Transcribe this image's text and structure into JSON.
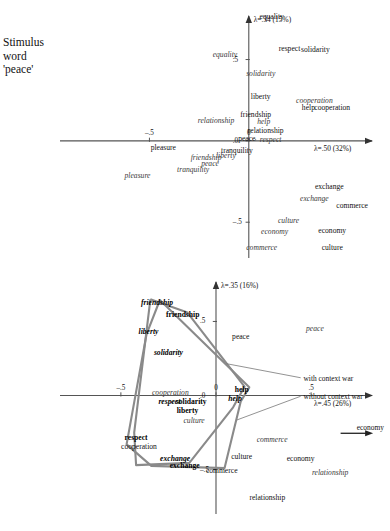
{
  "figure": {
    "stimulus_label": "Stimulus\nword\n'peace'",
    "stimulus_lines": [
      "Stimulus",
      "word",
      "'peace'"
    ]
  },
  "chart_data": [
    {
      "id": "top",
      "type": "scatter",
      "title": "",
      "xlabel": "λ=.50 (32%)",
      "ylabel": "λ=.34 (15%)",
      "xlim": [
        -0.95,
        0.62
      ],
      "ylim": [
        -0.72,
        0.78
      ],
      "xticks": [
        -0.5,
        0
      ],
      "xticklabels": [
        "–.5",
        "0"
      ],
      "yticks": [
        -0.5,
        0,
        0.5
      ],
      "yticklabels": [
        "–.5",
        ".0",
        ".5"
      ],
      "grid": false,
      "legend": "none",
      "points": [
        {
          "label": "equality",
          "style": "roman",
          "x": 0.115,
          "y": 0.76,
          "marker": false
        },
        {
          "label": "respect",
          "style": "roman",
          "x": 0.205,
          "y": 0.565,
          "marker": false
        },
        {
          "label": "solidarity",
          "style": "roman",
          "x": 0.335,
          "y": 0.56,
          "marker": false
        },
        {
          "label": "equality",
          "style": "italic",
          "x": -0.12,
          "y": 0.53,
          "marker": false
        },
        {
          "label": "solidarity",
          "style": "italic",
          "x": 0.06,
          "y": 0.41,
          "marker": false
        },
        {
          "label": "liberty",
          "style": "roman",
          "x": 0.06,
          "y": 0.27,
          "marker": false
        },
        {
          "label": "cooperation",
          "style": "italic",
          "x": 0.33,
          "y": 0.245,
          "marker": false
        },
        {
          "label": "help",
          "style": "roman",
          "x": 0.3,
          "y": 0.205,
          "marker": false
        },
        {
          "label": "cooperation",
          "style": "roman",
          "x": 0.42,
          "y": 0.205,
          "marker": false
        },
        {
          "label": "friendship",
          "style": "roman",
          "x": 0.035,
          "y": 0.16,
          "marker": false
        },
        {
          "label": "relationship",
          "style": "italic",
          "x": -0.165,
          "y": 0.125,
          "marker": false
        },
        {
          "label": "help",
          "style": "italic",
          "x": 0.075,
          "y": 0.118,
          "marker": false
        },
        {
          "label": "relationship",
          "style": "roman",
          "x": 0.085,
          "y": 0.06,
          "marker": false
        },
        {
          "label": "peace",
          "style": "roman",
          "x": -0.01,
          "y": 0.01,
          "marker": false
        },
        {
          "label": "respect",
          "style": "italic",
          "x": 0.11,
          "y": 0.008,
          "marker": true
        },
        {
          "label": "pleasure",
          "style": "roman",
          "x": -0.43,
          "y": -0.045,
          "marker": false
        },
        {
          "label": "tranquility",
          "style": "roman",
          "x": -0.06,
          "y": -0.065,
          "marker": false
        },
        {
          "label": "liberty",
          "style": "italic",
          "x": -0.115,
          "y": -0.095,
          "marker": false
        },
        {
          "label": "friendship",
          "style": "italic",
          "x": -0.215,
          "y": -0.105,
          "marker": false
        },
        {
          "label": "peace",
          "style": "italic",
          "x": -0.195,
          "y": -0.14,
          "marker": false
        },
        {
          "label": "tranquility",
          "style": "italic",
          "x": -0.28,
          "y": -0.18,
          "marker": false
        },
        {
          "label": "pleasure",
          "style": "italic",
          "x": -0.56,
          "y": -0.215,
          "marker": false
        },
        {
          "label": "exchange",
          "style": "roman",
          "x": 0.405,
          "y": -0.285,
          "marker": false
        },
        {
          "label": "exchange",
          "style": "italic",
          "x": 0.33,
          "y": -0.36,
          "marker": false
        },
        {
          "label": "commerce",
          "style": "roman",
          "x": 0.52,
          "y": -0.4,
          "marker": false
        },
        {
          "label": "culture",
          "style": "italic",
          "x": 0.2,
          "y": -0.495,
          "marker": false
        },
        {
          "label": "economy",
          "style": "italic",
          "x": 0.13,
          "y": -0.56,
          "marker": false
        },
        {
          "label": "economy",
          "style": "roman",
          "x": 0.42,
          "y": -0.555,
          "marker": false
        },
        {
          "label": "commerce",
          "style": "italic",
          "x": 0.065,
          "y": -0.66,
          "marker": false
        },
        {
          "label": "culture",
          "style": "roman",
          "x": 0.42,
          "y": -0.66,
          "marker": false
        }
      ]
    },
    {
      "id": "bottom",
      "type": "scatter",
      "title": "",
      "xlabel": "λ=.45 (26%)",
      "ylabel": "λ=.35 (16%)",
      "xlim": [
        -0.82,
        0.82
      ],
      "ylim": [
        -0.8,
        0.78
      ],
      "xticks": [
        -0.5,
        0,
        0.5
      ],
      "xticklabels": [
        "–.5",
        "0",
        ".5"
      ],
      "yticks": [
        -0.5,
        0,
        0.5
      ],
      "yticklabels": [
        "–.5",
        ".0",
        ".5"
      ],
      "grid": false,
      "legend": "none",
      "annotations": [
        {
          "text": "with context war",
          "x": 0.46,
          "y": 0.12
        },
        {
          "text": "without context war",
          "x": 0.46,
          "y": -0.005
        },
        {
          "text": "economy",
          "x": 0.74,
          "y": -0.215
        }
      ],
      "points": [
        {
          "label": "friendship",
          "style": "bolditalic",
          "x": -0.31,
          "y": 0.625,
          "marker": false
        },
        {
          "label": "friendship",
          "style": "bold",
          "x": -0.175,
          "y": 0.545,
          "marker": false
        },
        {
          "label": "peace",
          "style": "italic",
          "x": 0.52,
          "y": 0.45,
          "marker": false
        },
        {
          "label": "liberty",
          "style": "bolditalic",
          "x": -0.355,
          "y": 0.43,
          "marker": false
        },
        {
          "label": "peace",
          "style": "roman",
          "x": 0.13,
          "y": 0.395,
          "marker": false
        },
        {
          "label": "solidarity",
          "style": "bolditalic",
          "x": -0.25,
          "y": 0.285,
          "marker": false
        },
        {
          "label": "cooperation",
          "style": "italic",
          "x": -0.24,
          "y": 0.015,
          "marker": false
        },
        {
          "label": "help",
          "style": "bold",
          "x": 0.135,
          "y": 0.04,
          "marker": false
        },
        {
          "label": "help",
          "style": "bolditalic",
          "x": 0.1,
          "y": -0.025,
          "marker": false
        },
        {
          "label": "respect",
          "style": "bolditalic",
          "x": -0.245,
          "y": -0.045,
          "marker": false
        },
        {
          "label": "solidarity",
          "style": "bold",
          "x": -0.13,
          "y": -0.045,
          "marker": true
        },
        {
          "label": "liberty",
          "style": "bold",
          "x": -0.15,
          "y": -0.105,
          "marker": false
        },
        {
          "label": "culture",
          "style": "italic",
          "x": -0.115,
          "y": -0.17,
          "marker": false
        },
        {
          "label": "respect",
          "style": "bold",
          "x": -0.42,
          "y": -0.285,
          "marker": false
        },
        {
          "label": "cooperation",
          "style": "roman",
          "x": -0.405,
          "y": -0.345,
          "marker": false
        },
        {
          "label": "commerce",
          "style": "italic",
          "x": 0.295,
          "y": -0.3,
          "marker": false
        },
        {
          "label": "exchange",
          "style": "bolditalic",
          "x": -0.215,
          "y": -0.43,
          "marker": false
        },
        {
          "label": "culture",
          "style": "roman",
          "x": 0.135,
          "y": -0.415,
          "marker": false
        },
        {
          "label": "exchange",
          "style": "bold",
          "x": -0.165,
          "y": -0.475,
          "marker": false
        },
        {
          "label": "commerce",
          "style": "roman",
          "x": 0.03,
          "y": -0.51,
          "marker": false
        },
        {
          "label": "economy",
          "style": "roman",
          "x": 0.445,
          "y": -0.43,
          "marker": false
        },
        {
          "label": "relationship",
          "style": "italic",
          "x": 0.6,
          "y": -0.52,
          "marker": false
        },
        {
          "label": "relationship",
          "style": "roman",
          "x": 0.27,
          "y": -0.69,
          "marker": false
        }
      ],
      "polygons": [
        {
          "name": "with-context-war",
          "color": "#8a8a8a",
          "vertices": [
            [
              -0.345,
              0.65
            ],
            [
              -0.15,
              0.56
            ],
            [
              0.15,
              0.06
            ],
            [
              0.09,
              -0.08
            ],
            [
              -0.14,
              -0.455
            ],
            [
              -0.42,
              -0.47
            ],
            [
              -0.43,
              -0.25
            ],
            [
              -0.345,
              0.65
            ]
          ]
        },
        {
          "name": "without-context-war",
          "color": "#8a8a8a",
          "vertices": [
            [
              -0.295,
              0.645
            ],
            [
              -0.365,
              0.415
            ],
            [
              -0.47,
              -0.33
            ],
            [
              -0.34,
              -0.475
            ],
            [
              0.045,
              -0.49
            ],
            [
              0.13,
              -0.04
            ],
            [
              0.175,
              0.055
            ],
            [
              -0.295,
              0.645
            ]
          ]
        }
      ]
    }
  ]
}
